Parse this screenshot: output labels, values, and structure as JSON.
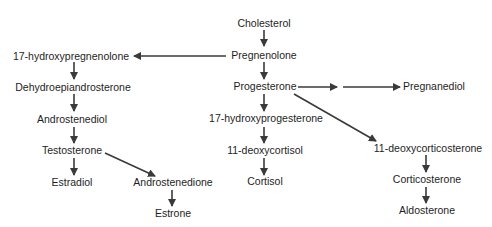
{
  "nodes": {
    "cholesterol": "Cholesterol",
    "pregnenolone": "Pregnenolone",
    "hydroxypregnenolone17": "17-hydroxypregnenolone",
    "dhea": "Dehydroepiandrosterone",
    "androstenediol": "Androstenediol",
    "testosterone": "Testosterone",
    "estradiol": "Estradiol",
    "androstenedione": "Androstenedione",
    "estrone": "Estrone",
    "progesterone": "Progesterone",
    "pregnanediol": "Pregnanediol",
    "hydroxyprogesterone17": "17-hydroxyprogesterone",
    "deoxycortisol11": "11-deoxycortisol",
    "cortisol": "Cortisol",
    "deoxycorticosterone11": "11-deoxycorticosterone",
    "corticosterone": "Corticosterone",
    "aldosterone": "Aldosterone"
  },
  "edges": [
    {
      "from": "Cholesterol",
      "to": "Pregnenolone"
    },
    {
      "from": "Pregnenolone",
      "to": "17-hydroxypregnenolone"
    },
    {
      "from": "Pregnenolone",
      "to": "Progesterone"
    },
    {
      "from": "17-hydroxypregnenolone",
      "to": "Dehydroepiandrosterone"
    },
    {
      "from": "Dehydroepiandrosterone",
      "to": "Androstenediol"
    },
    {
      "from": "Androstenediol",
      "to": "Testosterone"
    },
    {
      "from": "Testosterone",
      "to": "Estradiol"
    },
    {
      "from": "Testosterone",
      "to": "Androstenedione"
    },
    {
      "from": "Androstenedione",
      "to": "Estrone"
    },
    {
      "from": "Progesterone",
      "to": "Pregnanediol",
      "note": "two-step arrow"
    },
    {
      "from": "Progesterone",
      "to": "17-hydroxyprogesterone"
    },
    {
      "from": "Progesterone",
      "to": "11-deoxycorticosterone"
    },
    {
      "from": "17-hydroxyprogesterone",
      "to": "11-deoxycortisol"
    },
    {
      "from": "11-deoxycortisol",
      "to": "Cortisol"
    },
    {
      "from": "11-deoxycorticosterone",
      "to": "Corticosterone"
    },
    {
      "from": "Corticosterone",
      "to": "Aldosterone"
    }
  ],
  "colors": {
    "text": "#1e1e1e",
    "arrow": "#3a3a3a",
    "background": "#ffffff"
  }
}
